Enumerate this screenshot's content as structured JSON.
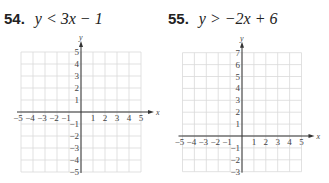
{
  "problems": [
    {
      "number": "54.",
      "inequality": "y < 3x − 1",
      "graph": {
        "x_label": "x",
        "y_label": "y",
        "x_range": [
          -5,
          5
        ],
        "y_range": [
          -5,
          5
        ],
        "x_ticks": [
          "−5",
          "−4",
          "−3",
          "−2",
          "−1",
          "1",
          "2",
          "3",
          "4",
          "5"
        ],
        "y_ticks": [
          "5",
          "4",
          "3",
          "2",
          "1",
          "−1",
          "−2",
          "−3",
          "−4",
          "−5"
        ]
      }
    },
    {
      "number": "55.",
      "inequality": "y > −2x + 6",
      "graph": {
        "x_label": "x",
        "y_label": "y",
        "x_range": [
          -5,
          5
        ],
        "y_range": [
          -3,
          7
        ],
        "x_ticks": [
          "−5",
          "−4",
          "−3",
          "−2",
          "−1",
          "1",
          "2",
          "3",
          "4",
          "5"
        ],
        "y_ticks": [
          "7",
          "6",
          "5",
          "4",
          "3",
          "2",
          "1",
          "−1",
          "−2",
          "−3"
        ]
      }
    }
  ],
  "colors": {
    "grid": "#d9d9d9",
    "axis": "#333333",
    "text": "#222222"
  }
}
